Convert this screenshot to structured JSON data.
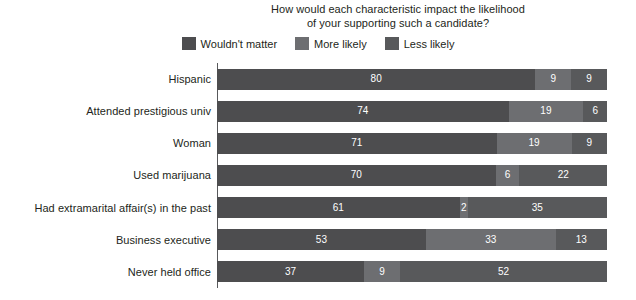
{
  "chart_data": {
    "type": "bar",
    "subtype": "stacked-horizontal-100",
    "title": "How would each characteristic impact the likelihood of your supporting such a candidate?",
    "title_lines": [
      "How would each characteristic impact the likelihood",
      "of your supporting such a candidate?"
    ],
    "xlabel": "",
    "ylabel": "",
    "grid": false,
    "legend_position": "top-center",
    "orientation": "horizontal",
    "categories": [
      "Hispanic",
      "Attended prestigious univ",
      "Woman",
      "Used marijuana",
      "Had extramarital affair(s) in the past",
      "Business executive",
      "Never held office"
    ],
    "series": [
      {
        "name": "Wouldn't matter",
        "color": "#4d4d4f",
        "values": [
          80,
          74,
          71,
          70,
          61,
          53,
          37
        ]
      },
      {
        "name": "More likely",
        "color": "#6d6e71",
        "values": [
          9,
          19,
          19,
          6,
          2,
          33,
          9
        ]
      },
      {
        "name": "Less likely",
        "color": "#58595b",
        "values": [
          9,
          6,
          9,
          22,
          35,
          13,
          52
        ]
      }
    ],
    "legend": [
      {
        "label": "Wouldn't matter",
        "color": "#4d4d4f"
      },
      {
        "label": "More likely",
        "color": "#6d6e71"
      },
      {
        "label": "Less likely",
        "color": "#58595b"
      }
    ],
    "value_labels_visible": true,
    "axis_color": "#58595b",
    "background_color": "#ffffff",
    "text_color": "#231f20",
    "value_label_color": "#ffffff"
  }
}
